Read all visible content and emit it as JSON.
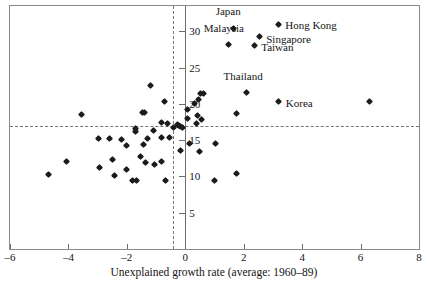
{
  "chart_data": {
    "type": "scatter",
    "title": "",
    "xlabel": "Unexplained growth rate (average: 1960–89)",
    "ylabel": "",
    "xlim": [
      -6,
      8
    ],
    "ylim": [
      0,
      33.5
    ],
    "xticks": [
      -6,
      -4,
      -2,
      0,
      2,
      4,
      6,
      8
    ],
    "xticklabels": [
      "–6",
      "–4",
      "–2",
      "0",
      "2",
      "4",
      "6",
      "8"
    ],
    "yticks": [
      5,
      10,
      15,
      20,
      25,
      30
    ],
    "yticklabels": [
      "5",
      "10",
      "15",
      "20",
      "25",
      "30"
    ],
    "grid": false,
    "legend": null,
    "reference_lines": {
      "vertical_dashed_x": -0.42,
      "horizontal_dashed_y": 16.9,
      "vertical_solid_x": 0
    },
    "labeled_points": [
      {
        "name": "Japan",
        "x": 1.65,
        "y": 30.4,
        "label_dx": -0.18,
        "label_dy": 2.4,
        "label_anchor": "center"
      },
      {
        "name": "Hong Kong",
        "x": 3.2,
        "y": 30.9,
        "label_dx": 0.22,
        "label_dy": 0.0,
        "label_anchor": "left"
      },
      {
        "name": "Singapore",
        "x": 2.55,
        "y": 29.3,
        "label_dx": 0.22,
        "label_dy": -0.3,
        "label_anchor": "left"
      },
      {
        "name": "Malaysia",
        "x": 1.48,
        "y": 28.2,
        "label_dx": -0.16,
        "label_dy": 2.2,
        "label_anchor": "center"
      },
      {
        "name": "Taiwan",
        "x": 2.38,
        "y": 28.1,
        "label_dx": 0.22,
        "label_dy": -0.2,
        "label_anchor": "left"
      },
      {
        "name": "Thailand",
        "x": 2.1,
        "y": 21.6,
        "label_dx": -0.12,
        "label_dy": 2.3,
        "label_anchor": "center"
      },
      {
        "name": "Korea",
        "x": 3.2,
        "y": 20.3,
        "label_dx": 0.24,
        "label_dy": -0.2,
        "label_anchor": "left"
      }
    ],
    "unlabeled_points": [
      {
        "x": 6.3,
        "y": 20.4
      },
      {
        "x": -1.2,
        "y": 22.6
      },
      {
        "x": 0.52,
        "y": 21.5
      },
      {
        "x": 0.62,
        "y": 21.5
      },
      {
        "x": 0.46,
        "y": 20.6
      },
      {
        "x": 0.3,
        "y": 20.1
      },
      {
        "x": -0.72,
        "y": 20.3
      },
      {
        "x": 0.06,
        "y": 19.2
      },
      {
        "x": 1.74,
        "y": 18.7
      },
      {
        "x": 0.42,
        "y": 18.4
      },
      {
        "x": -1.47,
        "y": 18.8
      },
      {
        "x": -1.4,
        "y": 18.8
      },
      {
        "x": -3.56,
        "y": 18.6
      },
      {
        "x": 0.06,
        "y": 18.0
      },
      {
        "x": 0.56,
        "y": 17.9
      },
      {
        "x": 0.38,
        "y": 17.3
      },
      {
        "x": -0.82,
        "y": 17.5
      },
      {
        "x": -0.62,
        "y": 17.3
      },
      {
        "x": -0.28,
        "y": 17.1
      },
      {
        "x": -0.22,
        "y": 17.0
      },
      {
        "x": -0.15,
        "y": 16.9
      },
      {
        "x": -0.1,
        "y": 16.75
      },
      {
        "x": -0.4,
        "y": 16.8
      },
      {
        "x": -1.7,
        "y": 16.6
      },
      {
        "x": -1.72,
        "y": 16.2
      },
      {
        "x": -1.1,
        "y": 16.4
      },
      {
        "x": -0.55,
        "y": 15.4
      },
      {
        "x": -0.8,
        "y": 15.4
      },
      {
        "x": -1.28,
        "y": 15.3
      },
      {
        "x": -2.2,
        "y": 15.1
      },
      {
        "x": -2.58,
        "y": 15.2
      },
      {
        "x": -2.98,
        "y": 15.3
      },
      {
        "x": 0.16,
        "y": 14.6
      },
      {
        "x": 1.02,
        "y": 14.6
      },
      {
        "x": -1.44,
        "y": 14.4
      },
      {
        "x": -2.02,
        "y": 14.2
      },
      {
        "x": -0.18,
        "y": 13.6
      },
      {
        "x": 0.48,
        "y": 13.5
      },
      {
        "x": -1.52,
        "y": 12.8
      },
      {
        "x": -2.48,
        "y": 12.3
      },
      {
        "x": -0.8,
        "y": 12.0
      },
      {
        "x": -1.36,
        "y": 11.9
      },
      {
        "x": -1.06,
        "y": 11.6
      },
      {
        "x": -4.05,
        "y": 12.0
      },
      {
        "x": -2.02,
        "y": 11.0
      },
      {
        "x": -2.92,
        "y": 11.2
      },
      {
        "x": 1.76,
        "y": 10.4
      },
      {
        "x": -4.68,
        "y": 10.3
      },
      {
        "x": -2.44,
        "y": 10.1
      },
      {
        "x": 1.0,
        "y": 9.5
      },
      {
        "x": -1.8,
        "y": 9.5
      },
      {
        "x": -1.68,
        "y": 9.5
      },
      {
        "x": -0.68,
        "y": 9.4
      }
    ]
  }
}
